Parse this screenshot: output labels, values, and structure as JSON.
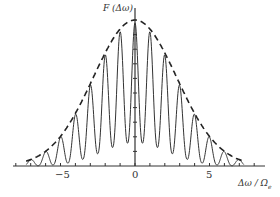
{
  "chart_data": {
    "type": "line",
    "title": "",
    "xlabel": "Δω/Ω_e",
    "ylabel": "F(Δω)",
    "xlim": [
      -8.5,
      8.5
    ],
    "ylim": [
      0,
      1
    ],
    "xticks": [
      -5,
      0,
      5
    ],
    "xtick_labels": [
      "−5",
      "0",
      "5"
    ],
    "grid": false,
    "legend": null,
    "series": [
      {
        "name": "envelope (dashed Gaussian)",
        "style": "dashed",
        "x": [
          -7,
          -6,
          -5,
          -4,
          -3,
          -2,
          -1,
          0,
          1,
          2,
          3,
          4,
          5,
          6,
          7
        ],
        "values": [
          0.02,
          0.06,
          0.14,
          0.26,
          0.44,
          0.65,
          0.87,
          1.0,
          0.87,
          0.65,
          0.44,
          0.26,
          0.14,
          0.06,
          0.02
        ]
      },
      {
        "name": "oscillating spectrum (solid)",
        "style": "solid",
        "peaks_x": [
          -7,
          -6,
          -5,
          -4,
          -3,
          -2,
          -1,
          0,
          1,
          2,
          3,
          4,
          5,
          6,
          7
        ],
        "peaks_y": [
          0.02,
          0.05,
          0.12,
          0.23,
          0.44,
          0.7,
          0.92,
          1.0,
          0.92,
          0.7,
          0.44,
          0.23,
          0.12,
          0.05,
          0.02
        ],
        "troughs_y": [
          0.0,
          0.01,
          0.02,
          0.03,
          0.07,
          0.12,
          0.15,
          0.15,
          0.12,
          0.07,
          0.03,
          0.02,
          0.01,
          0.0
        ]
      }
    ]
  },
  "labels": {
    "y_axis": "F (Δω)",
    "x_axis": "Δω / Ω",
    "x_axis_sub": "e",
    "ticks": [
      "−5",
      "0",
      "5"
    ]
  }
}
